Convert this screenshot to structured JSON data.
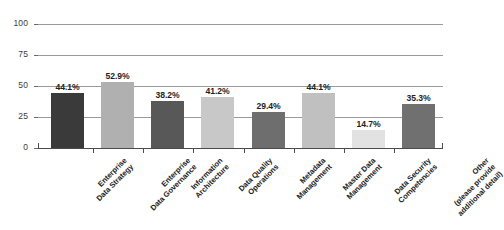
{
  "chart_data": {
    "type": "bar",
    "title": "",
    "subtitle": "",
    "xlabel": "",
    "ylabel": "",
    "ylim": [
      0,
      100
    ],
    "y_ticks": [
      0,
      25,
      50,
      75,
      100
    ],
    "y_tick_labels": [
      "0",
      "25",
      "50",
      "75",
      "100"
    ],
    "grid": true,
    "legend": "none",
    "orientation": "vertical",
    "value_label_format": "percent-one-decimal",
    "categories": [
      "Enterprise Data Strategy",
      "Enterprise Data Governance",
      "Information Architecture",
      "Data Quality Operations",
      "Metadata Management",
      "Master Data Management",
      "Data Security Competencies",
      "Other (please provide additional detail)"
    ],
    "category_label_lines": [
      [
        "Enterprise",
        "Data Strategy"
      ],
      [
        "Enterprise",
        "Data Governance"
      ],
      [
        "Information",
        "Architecture"
      ],
      [
        "Data Quality",
        "Operations"
      ],
      [
        "Metadata",
        "Management"
      ],
      [
        "Master Data",
        "Management"
      ],
      [
        "Data Security",
        "Competencies"
      ],
      [
        "Other",
        "(please provide",
        "additional detail)"
      ]
    ],
    "values": [
      44.1,
      52.9,
      38.2,
      41.2,
      29.4,
      44.1,
      14.7,
      35.3
    ],
    "value_labels": [
      "44.1%",
      "52.9%",
      "38.2%",
      "41.2%",
      "29.4%",
      "44.1%",
      "14.7%",
      "35.3%"
    ],
    "bar_colors": [
      "#3a3a3a",
      "#b0b0b0",
      "#585858",
      "#c8c8c8",
      "#6e6e6e",
      "#c0c0c0",
      "#e2e2e2",
      "#707070"
    ],
    "colors": {
      "background": "#ffffff",
      "gridline": "#9a9a9a",
      "axis": "#4a4a4a",
      "tick_text": "#3c3c3c",
      "value_text": "#1f1f1f",
      "category_text": "#222222"
    }
  }
}
